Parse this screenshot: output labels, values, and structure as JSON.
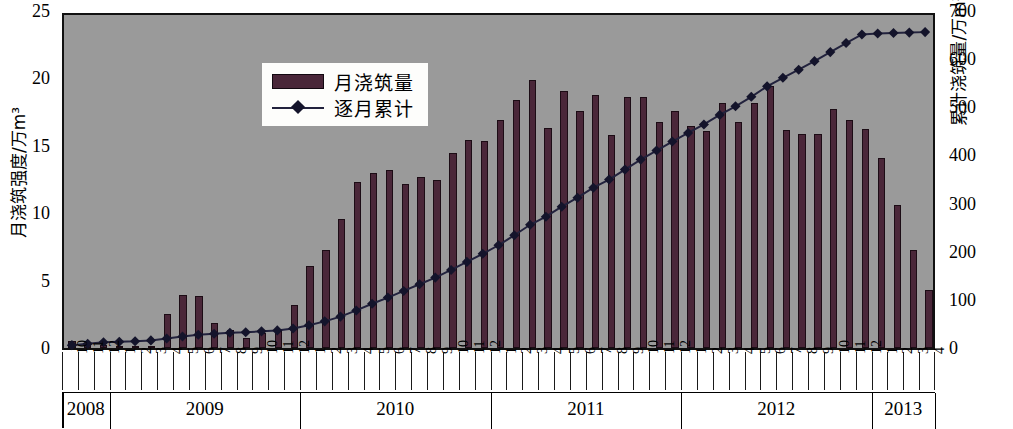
{
  "chart_data": {
    "type": "bar",
    "title": "",
    "xlabel": "",
    "ylabel": "月浇筑强度/万m³",
    "y2label": "累计浇筑量/万m³",
    "ylim": [
      0,
      25
    ],
    "y2lim": [
      0,
      700
    ],
    "yticks": [
      "0",
      "5",
      "10",
      "15",
      "20",
      "25"
    ],
    "y2ticks": [
      "0",
      "100",
      "200",
      "300",
      "400",
      "500",
      "600",
      "700"
    ],
    "grid": false,
    "legend_position": "upper-left-inside",
    "legend": [
      "月浇筑量",
      "逐月累计"
    ],
    "colors": {
      "bar": "#4a2739",
      "bar_edge": "#1c0c15",
      "line": "#22223d",
      "marker": "#14142b",
      "plot_background": "#9a9a9a",
      "page_background": "#ffffff",
      "axis": "#111111"
    },
    "years": [
      {
        "label": "2008",
        "months": [
          "10",
          "11",
          "12"
        ]
      },
      {
        "label": "2009",
        "months": [
          "1",
          "2",
          "3",
          "4",
          "5",
          "6",
          "7",
          "8",
          "9",
          "10",
          "11",
          "12"
        ]
      },
      {
        "label": "2010",
        "months": [
          "1",
          "2",
          "3",
          "4",
          "5",
          "6",
          "7",
          "8",
          "9",
          "10",
          "11",
          "12"
        ]
      },
      {
        "label": "2011",
        "months": [
          "1",
          "2",
          "3",
          "4",
          "5",
          "6",
          "7",
          "8",
          "9",
          "10",
          "11",
          "12"
        ]
      },
      {
        "label": "2012",
        "months": [
          "1",
          "2",
          "3",
          "4",
          "5",
          "6",
          "7",
          "8",
          "9",
          "10",
          "11",
          "12"
        ]
      },
      {
        "label": "2013",
        "months": [
          "1",
          "2",
          "3",
          "4"
        ]
      }
    ],
    "categories": [
      "2008-10",
      "2008-11",
      "2008-12",
      "2009-1",
      "2009-2",
      "2009-3",
      "2009-4",
      "2009-5",
      "2009-6",
      "2009-7",
      "2009-8",
      "2009-9",
      "2009-10",
      "2009-11",
      "2009-12",
      "2010-1",
      "2010-2",
      "2010-3",
      "2010-4",
      "2010-5",
      "2010-6",
      "2010-7",
      "2010-8",
      "2010-9",
      "2010-10",
      "2010-11",
      "2010-12",
      "2011-1",
      "2011-2",
      "2011-3",
      "2011-4",
      "2011-5",
      "2011-6",
      "2011-7",
      "2011-8",
      "2011-9",
      "2011-10",
      "2011-11",
      "2011-12",
      "2012-1",
      "2012-2",
      "2012-3",
      "2012-4",
      "2012-5",
      "2012-6",
      "2012-7",
      "2012-8",
      "2012-9",
      "2012-10",
      "2012-11",
      "2012-12",
      "2013-1",
      "2013-2",
      "2013-3",
      "2013-4"
    ],
    "series": [
      {
        "name": "月浇筑量",
        "kind": "bar",
        "axis": "left",
        "values": [
          0.55,
          0.3,
          0.25,
          0.1,
          0.12,
          0.15,
          2.5,
          3.95,
          3.85,
          1.85,
          1.3,
          0.75,
          1.1,
          1.35,
          3.2,
          6.1,
          7.3,
          9.6,
          12.3,
          13.0,
          13.2,
          12.2,
          12.7,
          12.45,
          14.45,
          15.45,
          15.35,
          16.95,
          18.4,
          19.85,
          16.3,
          19.05,
          17.55,
          18.75,
          15.8,
          18.65,
          18.6,
          16.8,
          17.55,
          16.45,
          16.1,
          18.2,
          16.75,
          18.15,
          19.45,
          16.2,
          15.85,
          15.85,
          17.75,
          16.95,
          16.25,
          14.1,
          10.6,
          7.3,
          4.3
        ]
      },
      {
        "name": "逐月累计",
        "kind": "line",
        "axis": "right",
        "values": [
          6,
          9,
          12,
          13,
          14,
          16,
          41,
          80,
          119,
          138,
          151,
          158,
          169,
          183,
          215,
          276,
          349,
          445,
          568,
          698,
          830,
          952,
          1079,
          1203,
          1348,
          1502,
          1656,
          1825,
          2009,
          2208,
          2371,
          2561,
          2737,
          2924,
          3082,
          3269,
          3455,
          3623,
          3798,
          3963,
          4124,
          4306,
          4473,
          4655,
          4849,
          5011,
          5170,
          5329,
          5506,
          5676,
          5838,
          5979,
          6085,
          6158,
          6201
        ],
        "values_display_scaled": [
          6,
          9,
          12,
          13,
          14,
          16,
          20,
          24,
          28,
          30,
          32,
          33,
          35,
          37,
          41,
          48,
          56,
          66,
          79,
          93,
          106,
          120,
          134,
          148,
          164,
          181,
          198,
          216,
          237,
          259,
          276,
          297,
          316,
          337,
          354,
          375,
          396,
          415,
          434,
          452,
          470,
          490,
          508,
          528,
          550,
          568,
          585,
          603,
          622,
          641,
          659,
          661,
          662,
          663,
          664
        ]
      }
    ]
  }
}
